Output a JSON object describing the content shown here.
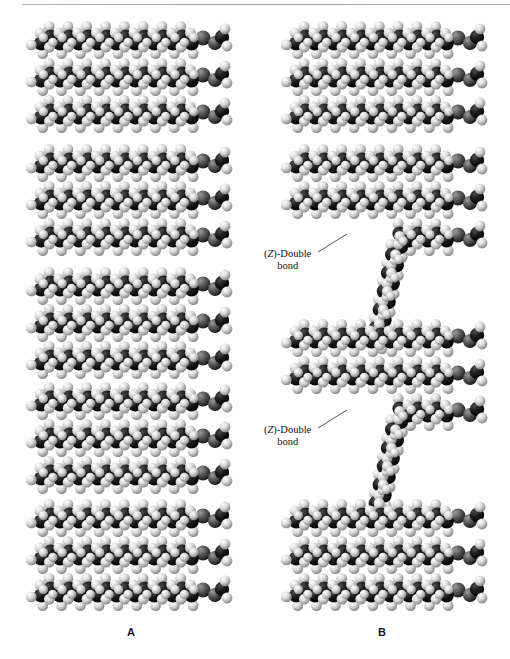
{
  "figure": {
    "type": "space-filling-molecular-model",
    "background_color": "#fefefe",
    "top_rule_color": "#9a9a9a"
  },
  "atom_colors": {
    "carbon": "#1c1c1c",
    "hydrogen": "#d9d9d9",
    "oxygen": "#585858",
    "highlight": "#f2f2f2",
    "shadow": "#000000"
  },
  "panels": [
    {
      "id": "panel-a",
      "letter": "A",
      "letter_position": {
        "x": 127,
        "y": 626
      },
      "molecule_count": 5,
      "chains_per_molecule": 3,
      "description": "Saturated triacylglycerols, all chains fully extended and stacked",
      "molecules": [
        {
          "top": 22,
          "kinked_chain": null
        },
        {
          "top": 145,
          "kinked_chain": null
        },
        {
          "top": 268,
          "kinked_chain": null
        },
        {
          "top": 383,
          "kinked_chain": null
        },
        {
          "top": 500,
          "kinked_chain": null
        }
      ]
    },
    {
      "id": "panel-b",
      "letter": "B",
      "letter_position": {
        "x": 378,
        "y": 626
      },
      "molecule_count": 4,
      "chains_per_molecule": 3,
      "description": "Unsaturated triacylglycerols; two molecules carry a (Z)-double bond kink",
      "molecules": [
        {
          "top": 22,
          "kinked_chain": null
        },
        {
          "top": 145,
          "kinked_chain": 2
        },
        {
          "top": 320,
          "kinked_chain": 2
        },
        {
          "top": 500,
          "kinked_chain": null
        }
      ]
    }
  ],
  "callouts": [
    {
      "id": "callout-1",
      "line1_prefix": "(",
      "line1_italic": "Z",
      "line1_suffix": ")-Double",
      "line2": "bond",
      "text_position": {
        "x": 264,
        "y": 248
      },
      "leader_from": {
        "x": 318,
        "y": 252
      },
      "leader_to": {
        "x": 347,
        "y": 234
      }
    },
    {
      "id": "callout-2",
      "line1_prefix": "(",
      "line1_italic": "Z",
      "line1_suffix": ")-Double",
      "line2": "bond",
      "text_position": {
        "x": 264,
        "y": 424
      },
      "leader_from": {
        "x": 318,
        "y": 428
      },
      "leader_to": {
        "x": 347,
        "y": 410
      }
    }
  ],
  "chain_geometry": {
    "carbon_radius": 7.2,
    "hydrogen_radius": 5.4,
    "oxygen_radius": 7.6,
    "bond_step_x": 9.4,
    "zigzag_amplitude": 3.4,
    "carbons_per_chain": 17,
    "chain_row_spacing": 37,
    "kink_angle_degrees": 92
  }
}
